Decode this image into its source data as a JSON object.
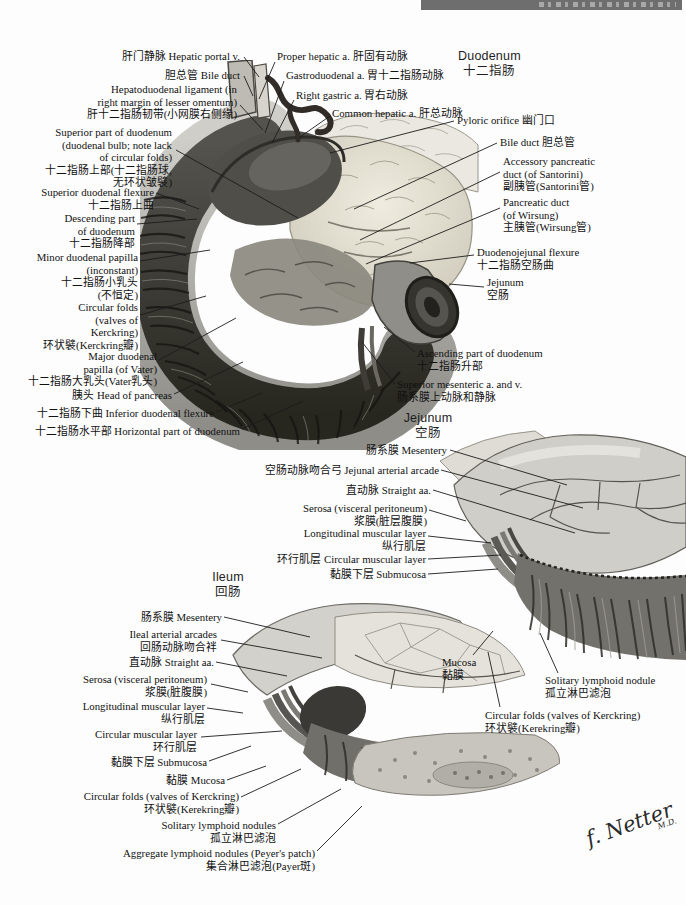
{
  "duodenum_section": {
    "title": "Duodenum\n十二指肠",
    "labels": {
      "hepatic_portal_v": "肝门静脉 Hepatic portal v.",
      "bile_duct": "胆总管 Bile duct",
      "hepatoduodenal_ligament": "Hepatoduodenal ligament (in\nright margin of lesser omentum)\n肝十二指肠韧带(小网膜右侧缘)",
      "superior_part": "Superior part of duodenum\n(duodenal bulb; note lack\nof circular folds)\n十二指肠上部(十二指肠球,\n无环状皱襞)",
      "superior_flexure": "Superior duodenal flexure\n十二指肠上曲",
      "descending_part": "Descending part\nof duodenum\n十二指肠降部",
      "minor_papilla": "Minor duodenal papilla\n(inconstant)\n十二指肠小乳头\n(不恒定)",
      "circular_folds": "Circular folds\n(valves of\nKerckring)\n环状襞(Kerckring瓣)",
      "major_papilla": "Major duodenal\npapilla (of Vater)\n十二指肠大乳头(Vater乳头)",
      "head_of_pancreas": "胰头 Head of pancreas",
      "inferior_flexure": "十二指肠下曲 Inferior duodenal flexure",
      "horizontal_part": "十二指肠水平部 Horizontal part of duodenum",
      "proper_hepatic_a": "Proper hepatic a. 肝固有动脉",
      "gastroduodenal_a": "Gastroduodenal a. 胃十二指肠动脉",
      "right_gastric_a": "Right gastric a. 胃右动脉",
      "common_hepatic_a": "Common hepatic a. 肝总动脉",
      "pyloric_orifice": "Pyloric orifice 幽门口",
      "bile_duct_right": "Bile duct 胆总管",
      "accessory_pancreatic_duct": "Accessory pancreatic\nduct (of Santorini)\n副胰管(Santorini管)",
      "pancreatic_duct": "Pancreatic duct\n(of Wirsung)\n主胰管(Wirsung管)",
      "duodenojejunal_flexure": "Duodenojejunal flexure\n十二指肠空肠曲",
      "jejunum": "Jejunum\n空肠",
      "ascending_part": "Ascending part of duodenum\n十二指肠升部",
      "superior_mesenteric": "Superior mesenteric a. and v.\n肠系膜上动脉和静脉"
    }
  },
  "jejunum_section": {
    "title": "Jejunum\n空肠",
    "labels": {
      "mesentery": "肠系膜 Mesentery",
      "arterial_arcade": "空肠动脉吻合弓 Jejunal arterial arcade",
      "straight_aa": "直动脉 Straight aa.",
      "serosa": "Serosa (visceral peritoneum)\n浆膜(脏层腹膜)",
      "longitudinal_layer": "Longitudinal muscular layer\n纵行肌层",
      "circular_layer": "环行肌层 Circular muscular layer",
      "submucosa": "黏膜下层 Submucosa",
      "mucosa": "Mucosa\n黏膜",
      "solitary_nodule": "Solitary lymphoid nodule\n孤立淋巴滤泡",
      "circular_folds": "Circular folds (valves of Kerckring)\n环状襞(Kerekring瓣)"
    }
  },
  "ileum_section": {
    "title": "Ileum\n回肠",
    "labels": {
      "mesentery": "肠系膜 Mesentery",
      "ileal_arcades": "Ileal arterial arcades\n回肠动脉吻合袢",
      "straight_aa": "直动脉 Straight aa.",
      "serosa": "Serosa (visceral peritoneum)\n浆膜(脏腹膜)",
      "longitudinal_layer": "Longitudinal muscular layer\n纵行肌层",
      "circular_layer": "Circular muscular layer\n环行肌层",
      "submucosa": "黏膜下层 Submucosa",
      "mucosa": "黏膜 Mucosa",
      "circular_folds": "Circular folds (valves of Kerckring)\n环状襞(Kerekring瓣)",
      "solitary_nodules": "Solitary lymphoid nodules\n孤立淋巴滤泡",
      "aggregate_nodules": "Aggregate lymphoid nodules (Peyer's patch)\n集合淋巴滤泡(Payer斑)"
    }
  },
  "signature": {
    "name": "f. Netter",
    "suffix": "M.D."
  }
}
